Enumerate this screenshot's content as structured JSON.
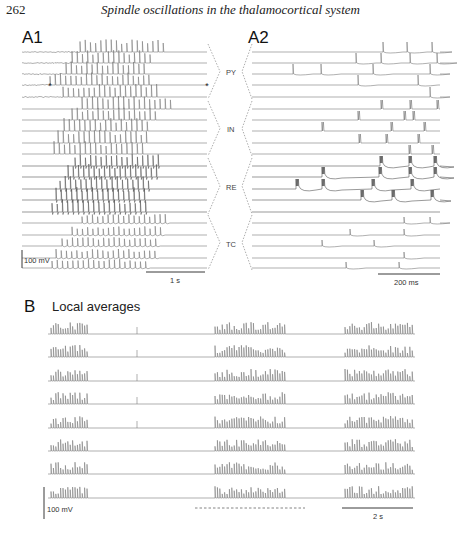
{
  "header": {
    "page_number": "262",
    "running_title": "Spindle oscillations in the thalamocortical system"
  },
  "figure": {
    "panel_A1": {
      "label": "A1",
      "x_start": 22,
      "x_end": 207,
      "scale_voltage": "100 mV",
      "scale_time": "1 s",
      "star_marker": "*"
    },
    "panel_A2": {
      "label": "A2",
      "x_start": 252,
      "x_end": 440,
      "scale_time": "200 ms"
    },
    "groups": [
      {
        "label": "PY",
        "rows": [
          0,
          1,
          2,
          3,
          4
        ]
      },
      {
        "label": "IN",
        "rows": [
          5,
          6,
          7,
          8,
          9
        ]
      },
      {
        "label": "RE",
        "rows": [
          10,
          11,
          12,
          13,
          14
        ]
      },
      {
        "label": "TC",
        "rows": [
          15,
          16,
          17,
          18,
          19
        ]
      }
    ],
    "row_baselines": [
      52,
      63,
      74,
      85,
      97,
      109,
      120,
      131,
      143,
      154,
      166,
      177,
      189,
      200,
      212,
      223,
      235,
      246,
      258,
      268
    ],
    "A1_onsets": [
      80,
      72,
      66,
      50,
      63,
      82,
      72,
      64,
      58,
      54,
      75,
      68,
      60,
      56,
      52,
      82,
      72,
      62,
      56,
      52
    ],
    "A1_offsets": [
      168,
      155,
      148,
      152,
      160,
      172,
      160,
      152,
      148,
      146,
      162,
      158,
      152,
      148,
      146,
      170,
      165,
      160,
      155,
      150
    ],
    "A2_spikes": [
      [
        383,
        407,
        432
      ],
      [
        356,
        381,
        410,
        437
      ],
      [
        293,
        321,
        373,
        430
      ],
      [
        358,
        418
      ],
      [
        430
      ],
      [
        381,
        410,
        437
      ],
      [
        358,
        404,
        413
      ],
      [
        322,
        391,
        424
      ],
      [
        359,
        386,
        418
      ],
      [
        409,
        432
      ],
      [
        380,
        409,
        434
      ],
      [
        322,
        379,
        409,
        434
      ],
      [
        296,
        322,
        372,
        411
      ],
      [
        361,
        392,
        431
      ],
      [],
      [
        404,
        430
      ],
      [
        350,
        404
      ],
      [
        322,
        374
      ],
      [
        404
      ],
      [
        346,
        399
      ]
    ],
    "panel_B": {
      "label": "B",
      "title": "Local averages",
      "x_start": 48,
      "x_end": 415,
      "row_baselines": [
        334,
        357,
        381,
        404,
        428,
        451,
        474,
        498
      ],
      "bursts": [
        [
          51,
          88
        ],
        [
          215,
          285
        ],
        [
          345,
          413
        ]
      ],
      "isolated_spikes": [
        137
      ],
      "scale_voltage": "100 mV",
      "scale_time": "2 s"
    }
  },
  "colors": {
    "trace": "#7a7a7a",
    "ink": "#222222",
    "dashed": "#8a8a8a"
  }
}
